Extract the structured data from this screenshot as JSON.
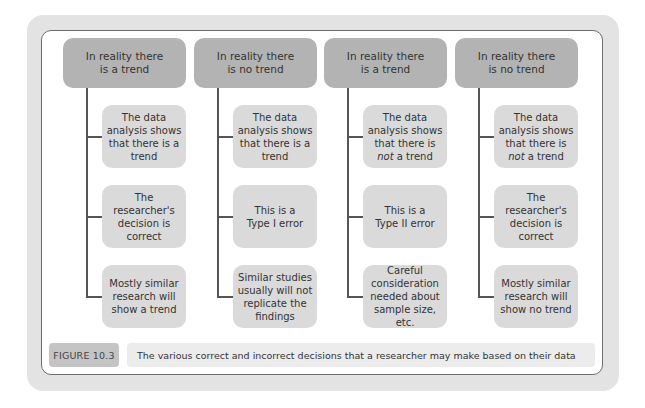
{
  "figure": {
    "label": "FIGURE 10.3",
    "caption": "The various correct and incorrect decisions that a researcher may make based on their data"
  },
  "columns": [
    {
      "header": [
        "In reality there",
        "is a trend"
      ],
      "children": [
        {
          "lines": [
            "The data",
            "analysis shows",
            "that there is a",
            "trend"
          ]
        },
        {
          "lines": [
            "The researcher's",
            "decision is",
            "correct"
          ]
        },
        {
          "lines": [
            "Mostly similar",
            "research will",
            "show a trend"
          ]
        }
      ]
    },
    {
      "header": [
        "In reality there",
        "is no trend"
      ],
      "children": [
        {
          "lines": [
            "The data",
            "analysis shows",
            "that there is a",
            "trend"
          ]
        },
        {
          "lines": [
            "This is a",
            "Type I error"
          ]
        },
        {
          "lines": [
            "Similar studies",
            "usually will not",
            "replicate the",
            "findings"
          ]
        }
      ]
    },
    {
      "header": [
        "In reality there",
        "is a trend"
      ],
      "children": [
        {
          "lines": [
            "The data",
            "analysis shows",
            "that there is",
            "not a trend"
          ],
          "italic_word": "not"
        },
        {
          "lines": [
            "This is a",
            "Type II error"
          ]
        },
        {
          "lines": [
            "Careful",
            "consideration",
            "needed about",
            "sample size, etc."
          ]
        }
      ]
    },
    {
      "header": [
        "In reality there",
        "is no trend"
      ],
      "children": [
        {
          "lines": [
            "The data",
            "analysis shows",
            "that there is",
            "not a trend"
          ],
          "italic_word": "not"
        },
        {
          "lines": [
            "The researcher's",
            "decision is",
            "correct"
          ]
        },
        {
          "lines": [
            "Mostly similar",
            "research will",
            "show no trend"
          ]
        }
      ]
    }
  ],
  "colors": {
    "frame": "#e3e3e3",
    "header_box": "#b3b3b3",
    "child_box": "#dadada",
    "connector": "#555555",
    "caption_label": "#c4c4c4",
    "caption_bar": "#ececec"
  }
}
